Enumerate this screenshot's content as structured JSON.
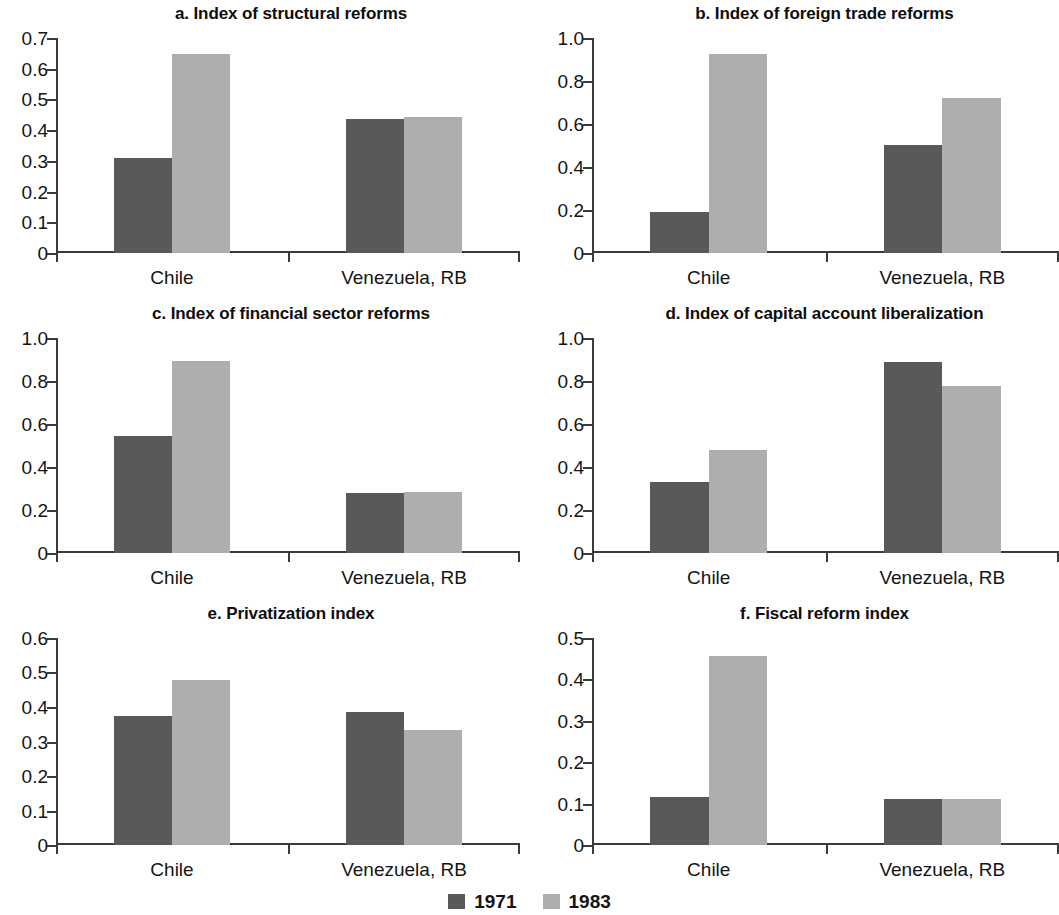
{
  "figure": {
    "background_color": "#ffffff",
    "series_colors": {
      "1971": "#595959",
      "1983": "#aeaeae"
    }
  },
  "legend": {
    "position": "bottom-center",
    "items": [
      {
        "label": "1971",
        "color": "#595959",
        "swatch_name": "legend-swatch-1971"
      },
      {
        "label": "1983",
        "color": "#aeaeae",
        "swatch_name": "legend-swatch-1983"
      }
    ]
  },
  "chart_data": [
    {
      "id": "a",
      "type": "bar",
      "title": "a. Index of structural reforms",
      "xlabel": "",
      "ylabel": "",
      "categories": [
        "Chile",
        "Venezuela, RB"
      ],
      "ylim": [
        0,
        0.7
      ],
      "yticks": [
        "0",
        "0.1",
        "0.2",
        "0.3",
        "0.4",
        "0.5",
        "0.6",
        "0.7"
      ],
      "ytick_values": [
        0,
        0.1,
        0.2,
        0.3,
        0.4,
        0.5,
        0.6,
        0.7
      ],
      "grid": false,
      "legend_position": "figure-bottom",
      "series": [
        {
          "name": "1971",
          "color": "#595959",
          "values": [
            0.31,
            0.435
          ]
        },
        {
          "name": "1983",
          "color": "#aeaeae",
          "values": [
            0.648,
            0.443
          ]
        }
      ]
    },
    {
      "id": "b",
      "type": "bar",
      "title": "b. Index of foreign trade reforms",
      "xlabel": "",
      "ylabel": "",
      "categories": [
        "Chile",
        "Venezuela, RB"
      ],
      "ylim": [
        0,
        1.0
      ],
      "yticks": [
        "0",
        "0.2",
        "0.4",
        "0.6",
        "0.8",
        "1.0"
      ],
      "ytick_values": [
        0,
        0.2,
        0.4,
        0.6,
        0.8,
        1.0
      ],
      "grid": false,
      "legend_position": "figure-bottom",
      "series": [
        {
          "name": "1971",
          "color": "#595959",
          "values": [
            0.19,
            0.503
          ]
        },
        {
          "name": "1983",
          "color": "#aeaeae",
          "values": [
            0.925,
            0.723
          ]
        }
      ]
    },
    {
      "id": "c",
      "type": "bar",
      "title": "c. Index of financial sector reforms",
      "xlabel": "",
      "ylabel": "",
      "categories": [
        "Chile",
        "Venezuela, RB"
      ],
      "ylim": [
        0,
        1.0
      ],
      "yticks": [
        "0",
        "0.2",
        "0.4",
        "0.6",
        "0.8",
        "1.0"
      ],
      "ytick_values": [
        0,
        0.2,
        0.4,
        0.6,
        0.8,
        1.0
      ],
      "grid": false,
      "legend_position": "figure-bottom",
      "series": [
        {
          "name": "1971",
          "color": "#595959",
          "values": [
            0.542,
            0.281
          ]
        },
        {
          "name": "1983",
          "color": "#aeaeae",
          "values": [
            0.895,
            0.283
          ]
        }
      ]
    },
    {
      "id": "d",
      "type": "bar",
      "title": "d. Index of capital account liberalization",
      "xlabel": "",
      "ylabel": "",
      "categories": [
        "Chile",
        "Venezuela, RB"
      ],
      "ylim": [
        0,
        1.0
      ],
      "yticks": [
        "0",
        "0.2",
        "0.4",
        "0.6",
        "0.8",
        "1.0"
      ],
      "ytick_values": [
        0,
        0.2,
        0.4,
        0.6,
        0.8,
        1.0
      ],
      "grid": false,
      "legend_position": "figure-bottom",
      "series": [
        {
          "name": "1971",
          "color": "#595959",
          "values": [
            0.329,
            0.888
          ]
        },
        {
          "name": "1983",
          "color": "#aeaeae",
          "values": [
            0.481,
            0.775
          ]
        }
      ]
    },
    {
      "id": "e",
      "type": "bar",
      "title": "e. Privatization index",
      "xlabel": "",
      "ylabel": "",
      "categories": [
        "Chile",
        "Venezuela, RB"
      ],
      "ylim": [
        0,
        0.6
      ],
      "yticks": [
        "0",
        "0.1",
        "0.2",
        "0.3",
        "0.4",
        "0.5",
        "0.6"
      ],
      "ytick_values": [
        0,
        0.1,
        0.2,
        0.3,
        0.4,
        0.5,
        0.6
      ],
      "grid": false,
      "legend_position": "figure-bottom",
      "series": [
        {
          "name": "1971",
          "color": "#595959",
          "values": [
            0.375,
            0.385
          ]
        },
        {
          "name": "1983",
          "color": "#aeaeae",
          "values": [
            0.477,
            0.332
          ]
        }
      ]
    },
    {
      "id": "f",
      "type": "bar",
      "title": "f. Fiscal reform index",
      "xlabel": "",
      "ylabel": "",
      "categories": [
        "Chile",
        "Venezuela, RB"
      ],
      "ylim": [
        0,
        0.5
      ],
      "yticks": [
        "0",
        "0.1",
        "0.2",
        "0.3",
        "0.4",
        "0.5"
      ],
      "ytick_values": [
        0,
        0.1,
        0.2,
        0.3,
        0.4,
        0.5
      ],
      "grid": false,
      "legend_position": "figure-bottom",
      "series": [
        {
          "name": "1971",
          "color": "#595959",
          "values": [
            0.115,
            0.111
          ]
        },
        {
          "name": "1983",
          "color": "#aeaeae",
          "values": [
            0.456,
            0.11
          ]
        }
      ]
    }
  ]
}
